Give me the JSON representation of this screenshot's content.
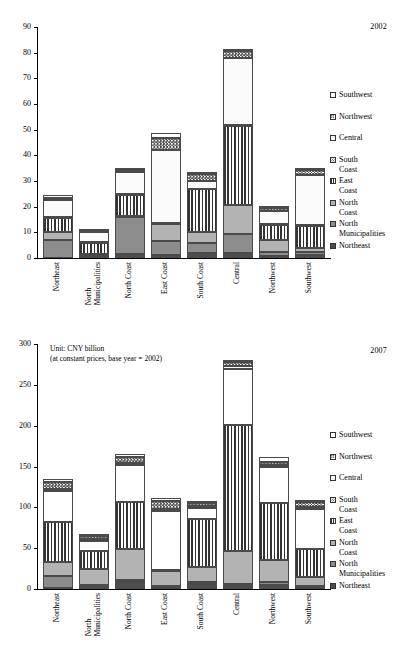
{
  "chart_data": [
    {
      "type": "bar",
      "title": "2002",
      "subtitle": "",
      "stacked": true,
      "xlabel": "",
      "ylabel": "",
      "ylim": [
        0,
        90
      ],
      "ytick_values": [
        0,
        10,
        20,
        30,
        40,
        50,
        60,
        70,
        80,
        90
      ],
      "ytick_labels": [
        "0",
        "10",
        "20",
        "30",
        "40",
        "50",
        "60",
        "70",
        "80",
        "90"
      ],
      "grid": false,
      "legend_position": "right",
      "categories": [
        "Northeast",
        "North Municipalities",
        "North Coast",
        "East Coast",
        "South Coast",
        "Central",
        "Northwest",
        "Southwest"
      ],
      "series": [
        {
          "name": "Northeast",
          "values": [
            0.2,
            0.5,
            1.5,
            1.2,
            1.8,
            2.0,
            0.8,
            1.3
          ]
        },
        {
          "name": "North Municipalities",
          "values": [
            6.8,
            0.3,
            14.5,
            5.5,
            4.0,
            7.2,
            1.5,
            1.0
          ]
        },
        {
          "name": "North Coast",
          "values": [
            3.2,
            0.6,
            0.5,
            6.5,
            4.3,
            11.3,
            4.7,
            1.5
          ]
        },
        {
          "name": "East Coast",
          "values": [
            5.5,
            4.6,
            7.9,
            0.3,
            16.6,
            31.0,
            6.0,
            8.7
          ]
        },
        {
          "name": "South Coast",
          "values": [
            0.3,
            0.2,
            0.4,
            0.3,
            0.3,
            0.4,
            0.3,
            0.3
          ]
        },
        {
          "name": "Central",
          "values": [
            6.6,
            4.1,
            8.9,
            28.1,
            3.0,
            26.2,
            5.0,
            19.5
          ]
        },
        {
          "name": "Northwest",
          "values": [
            0.9,
            0.2,
            0.6,
            5.0,
            2.8,
            2.6,
            1.1,
            2.0
          ]
        },
        {
          "name": "Southwest",
          "values": [
            0.9,
            0.2,
            0.9,
            1.9,
            0.5,
            0.6,
            0.4,
            0.3
          ]
        }
      ],
      "totals": [
        24.4,
        10.7,
        35.2,
        48.8,
        33.3,
        81.3,
        19.8,
        34.6
      ]
    },
    {
      "type": "bar",
      "title": "2007",
      "subtitle": "Unit: CNY billion\n(at constant prices, base year = 2002)",
      "stacked": true,
      "xlabel": "",
      "ylabel": "",
      "ylim": [
        0,
        300
      ],
      "ytick_values": [
        0,
        50,
        100,
        150,
        200,
        250,
        300
      ],
      "ytick_labels": [
        "0",
        "50",
        "100",
        "150",
        "200",
        "250",
        "300"
      ],
      "grid": false,
      "legend_position": "right",
      "categories": [
        "Northeast",
        "North Municipalities",
        "North Coast",
        "East Coast",
        "South Coast",
        "Central",
        "Northwest",
        "Southwest"
      ],
      "series": [
        {
          "name": "Northeast",
          "values": [
            1.0,
            3.5,
            9.0,
            2.5,
            6.5,
            4.0,
            5.5,
            2.0
          ]
        },
        {
          "name": "North Municipalities",
          "values": [
            15.5,
            1.5,
            2.0,
            1.5,
            2.0,
            2.5,
            3.0,
            2.0
          ]
        },
        {
          "name": "North Coast",
          "values": [
            17.0,
            19.5,
            38.5,
            18.0,
            18.5,
            39.5,
            26.5,
            10.5
          ]
        },
        {
          "name": "East Coast",
          "values": [
            48.5,
            22.0,
            57.0,
            1.5,
            59.0,
            155.0,
            70.5,
            35.0
          ]
        },
        {
          "name": "South Coast",
          "values": [
            38.0,
            12.5,
            45.0,
            71.5,
            13.0,
            69.0,
            44.0,
            48.5
          ]
        },
        {
          "name": "Central",
          "values": [
            3.0,
            2.0,
            3.0,
            3.5,
            2.5,
            2.5,
            2.5,
            2.5
          ]
        },
        {
          "name": "Northwest",
          "values": [
            8.0,
            3.5,
            7.5,
            9.0,
            4.0,
            5.5,
            4.0,
            5.5
          ]
        },
        {
          "name": "Southwest",
          "values": [
            4.0,
            1.0,
            3.0,
            4.0,
            2.0,
            3.0,
            6.0,
            1.5
          ]
        }
      ],
      "totals": [
        135.0,
        65.5,
        165.0,
        111.5,
        107.5,
        281.0,
        162.0,
        107.5
      ]
    }
  ],
  "legend": {
    "items": [
      {
        "label": "Southwest",
        "pattern": "southwest",
        "swatch_class": "p-southwest"
      },
      {
        "label": "Northwest",
        "pattern": "northwest",
        "swatch_class": "p-northwest"
      },
      {
        "label": "Central",
        "pattern": "central",
        "swatch_class": "p-central"
      },
      {
        "label": "South Coast",
        "pattern": "south-coast",
        "swatch_class": "p-southcoast"
      },
      {
        "label": "East Coast",
        "pattern": "east-coast",
        "swatch_class": "p-eastcoast"
      },
      {
        "label": "North Coast",
        "pattern": "north-coast",
        "swatch_class": "p-northcoast"
      },
      {
        "label": "North\nMunicipalities",
        "pattern": "north-municipalities",
        "swatch_class": "p-northmuni"
      },
      {
        "label": "Northeast",
        "pattern": "northeast",
        "swatch_class": "p-northeast"
      }
    ]
  },
  "colors": {
    "northeast": "#4d4d4d",
    "north_municipalities": "#8c8c8c",
    "north_coast": "#b3b3b3",
    "east_coast": "#333333",
    "south_coast": "#333333",
    "central": "#fbfbfb",
    "northwest": "#444444",
    "southwest": "#ffffff",
    "axis": "#000000"
  }
}
